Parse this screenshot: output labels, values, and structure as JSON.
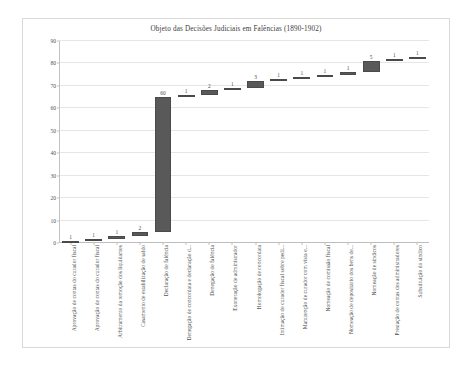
{
  "chart_data": {
    "type": "bar",
    "subtype": "waterfall-cumulative",
    "title": "Objeto das Decisões Judiciais em Falências (1890-1902)",
    "xlabel": "",
    "ylabel": "",
    "ylim": [
      0,
      90
    ],
    "ytick_step": 10,
    "yticks": [
      0,
      10,
      20,
      30,
      40,
      50,
      60,
      70,
      80,
      90
    ],
    "grid": true,
    "legend": false,
    "bar_color": "#595959",
    "categories": [
      "Aprovação de contas do curador fiscal",
      "Aprovação de contas do curador fiscal",
      "Arbitramento da remoção dos liquidantes",
      "Casamento de estabilização de saldo",
      "Declaração de falência",
      "Denegação de concordata e declaração d...",
      "Denegação de falência",
      "Exoneração de administrador",
      "Homologação de concordata",
      "Intimação de curador fiscal sobre pedi...",
      "Manutenção de curador com vista e...",
      "Nomeação de comissão fiscal",
      "Nomeação de depositário dos bens de...",
      "Nomeação de síndicos",
      "Prestação de contas dos administradores",
      "Substituição do síndico"
    ],
    "values": [
      1,
      1,
      1,
      2,
      60,
      1,
      2,
      1,
      3,
      1,
      1,
      1,
      1,
      5,
      1,
      1
    ],
    "data_labels": [
      "1",
      "1",
      "1",
      "2",
      "60",
      "1",
      "2",
      "1",
      "3",
      "1",
      "1",
      "1",
      "1",
      "5",
      "1",
      "1"
    ],
    "cumulative_start": [
      0,
      1,
      2,
      3,
      5,
      65,
      66,
      68,
      69,
      72,
      73,
      74,
      75,
      76,
      81,
      82
    ],
    "cumulative_end": [
      1,
      2,
      3,
      5,
      65,
      66,
      68,
      69,
      72,
      73,
      74,
      75,
      76,
      81,
      82,
      83
    ]
  }
}
